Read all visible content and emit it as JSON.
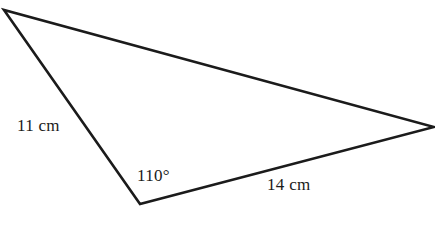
{
  "figure": {
    "shape_type": "triangle",
    "background_color": "#ffffff",
    "stroke_color": "#1b1b1b",
    "stroke_width": 2.6,
    "canvas": {
      "width": 435,
      "height": 240
    },
    "vertices": [
      {
        "name": "top-left-vertex",
        "x": 4,
        "y": 10
      },
      {
        "name": "bottom-left-vertex",
        "x": 140,
        "y": 204
      },
      {
        "name": "right-vertex",
        "x": 434,
        "y": 127
      }
    ],
    "path": "M 4 10 L 140 204 L 434 127 Z"
  },
  "labels": {
    "side_left": "11 cm",
    "angle": "110°",
    "side_bottom": "14 cm"
  },
  "chart_data": {
    "type": "diagram",
    "title": "",
    "shape": "triangle",
    "annotations": [
      {
        "text": "11 cm",
        "kind": "side-length",
        "value": 11,
        "unit": "cm",
        "edge": "top-left-vertex to bottom-left-vertex"
      },
      {
        "text": "110°",
        "kind": "angle",
        "value": 110,
        "unit": "degrees",
        "at": "bottom-left-vertex"
      },
      {
        "text": "14 cm",
        "kind": "side-length",
        "value": 14,
        "unit": "cm",
        "edge": "bottom-left-vertex to right-vertex"
      }
    ]
  }
}
